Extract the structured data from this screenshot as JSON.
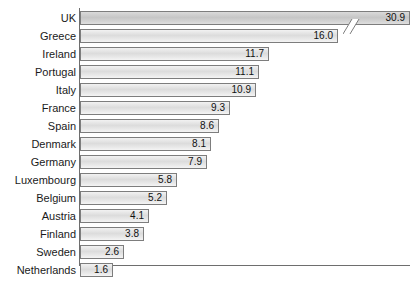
{
  "chart_data": {
    "type": "bar",
    "orientation": "horizontal",
    "title": "",
    "subtitle": "",
    "xlabel": "",
    "ylabel": "",
    "grid": false,
    "legend": null,
    "axis_break": true,
    "axis_break_note": "UK bar is truncated with a diagonal break mark before its value label",
    "xlim": [
      0,
      17
    ],
    "categories": [
      "UK",
      "Greece",
      "Ireland",
      "Portugal",
      "Italy",
      "France",
      "Spain",
      "Denmark",
      "Germany",
      "Luxembourg",
      "Belgium",
      "Austria",
      "Finland",
      "Sweden",
      "Netherlands"
    ],
    "values": [
      30.9,
      16.0,
      11.7,
      11.1,
      10.9,
      9.3,
      8.6,
      8.1,
      7.9,
      5.8,
      5.2,
      4.1,
      3.8,
      2.6,
      1.6
    ],
    "value_labels": [
      "30.9",
      "16.0",
      "11.7",
      "11.1",
      "10.9",
      "9.3",
      "8.6",
      "8.1",
      "7.9",
      "5.8",
      "5.2",
      "4.1",
      "3.8",
      "2.6",
      "1.6"
    ]
  },
  "bars": [
    {
      "label": "UK",
      "value": 30.9,
      "value_label": "30.9",
      "bar_px": 330,
      "highlight": true,
      "broken": true
    },
    {
      "label": "Greece",
      "value": 16.0,
      "value_label": "16.0",
      "bar_px": 258,
      "highlight": false,
      "broken": false
    },
    {
      "label": "Ireland",
      "value": 11.7,
      "value_label": "11.7",
      "bar_px": 189,
      "highlight": false,
      "broken": false
    },
    {
      "label": "Portugal",
      "value": 11.1,
      "value_label": "11.1",
      "bar_px": 179,
      "highlight": false,
      "broken": false
    },
    {
      "label": "Italy",
      "value": 10.9,
      "value_label": "10.9",
      "bar_px": 176,
      "highlight": false,
      "broken": false
    },
    {
      "label": "France",
      "value": 9.3,
      "value_label": "9.3",
      "bar_px": 150,
      "highlight": false,
      "broken": false
    },
    {
      "label": "Spain",
      "value": 8.6,
      "value_label": "8.6",
      "bar_px": 139,
      "highlight": false,
      "broken": false
    },
    {
      "label": "Denmark",
      "value": 8.1,
      "value_label": "8.1",
      "bar_px": 131,
      "highlight": false,
      "broken": false
    },
    {
      "label": "Germany",
      "value": 7.9,
      "value_label": "7.9",
      "bar_px": 127,
      "highlight": false,
      "broken": false
    },
    {
      "label": "Luxembourg",
      "value": 5.8,
      "value_label": "5.8",
      "bar_px": 97,
      "highlight": false,
      "broken": false
    },
    {
      "label": "Belgium",
      "value": 5.2,
      "value_label": "5.2",
      "bar_px": 87,
      "highlight": false,
      "broken": false
    },
    {
      "label": "Austria",
      "value": 4.1,
      "value_label": "4.1",
      "bar_px": 69,
      "highlight": false,
      "broken": false
    },
    {
      "label": "Finland",
      "value": 3.8,
      "value_label": "3.8",
      "bar_px": 64,
      "highlight": false,
      "broken": false
    },
    {
      "label": "Sweden",
      "value": 2.6,
      "value_label": "2.6",
      "bar_px": 44,
      "highlight": false,
      "broken": false
    },
    {
      "label": "Netherlands",
      "value": 1.6,
      "value_label": "1.6",
      "bar_px": 33,
      "highlight": false,
      "broken": false
    }
  ],
  "colors": {
    "bar_fill": "#e2e2e2",
    "bar_fill_highlight": "#cccccc",
    "bar_stroke": "#7d7d7d",
    "axis": "#6e6e6e",
    "text": "#1a1a1a",
    "background": "#ffffff"
  },
  "layout": {
    "row_height": 18,
    "bar_height": 14,
    "axis_x_px": 79,
    "first_row_top": 9
  }
}
